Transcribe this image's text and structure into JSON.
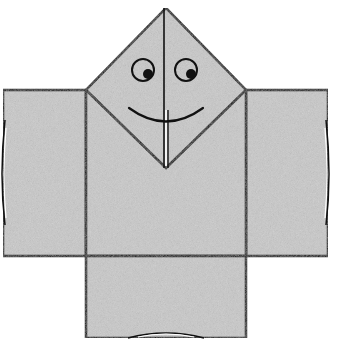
{
  "figure": {
    "colors": {
      "paper_fill": "#c9c9c9",
      "stroke": "#111111",
      "background": "#ffffff",
      "crease_highlight": "#ffffff"
    },
    "parts": [
      {
        "name": "head-diamond",
        "points": [
          [
            166,
            8
          ],
          [
            246,
            90
          ],
          [
            166,
            168
          ],
          [
            86,
            90
          ]
        ]
      },
      {
        "name": "left-arm",
        "rect": [
          3,
          90,
          83,
          166
        ]
      },
      {
        "name": "right-arm",
        "rect": [
          246,
          90,
          82,
          166
        ]
      },
      {
        "name": "torso",
        "rect": [
          86,
          90,
          160,
          166
        ]
      },
      {
        "name": "lower-panel",
        "rect": [
          86,
          256,
          160,
          82
        ]
      }
    ],
    "face": {
      "left_eye": {
        "cx": 143,
        "cy": 70,
        "r": 11,
        "pupil": [
          148,
          74,
          5
        ]
      },
      "right_eye": {
        "cx": 186,
        "cy": 70,
        "r": 11,
        "pupil": [
          191,
          74,
          5
        ]
      },
      "smile": "M129,108 Q166,135 203,108"
    }
  },
  "cropped_caption": ""
}
